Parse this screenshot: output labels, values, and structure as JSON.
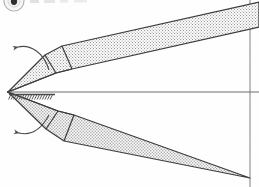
{
  "figure": {
    "kind": "technical-line-drawing",
    "canvas": {
      "width": 259,
      "height": 187
    },
    "background_color": "#fefefe",
    "ink_color": "#3a3a3a",
    "stipple_color": "#8e8e8e",
    "stipple_fill_tone": "#d2d2d2",
    "marker": {
      "name": "figure-number-badge",
      "label": "",
      "clipped": true,
      "cx": 14,
      "cy": 1,
      "r": 10
    },
    "axis": {
      "name": "axis-of-symmetry",
      "y": 92,
      "x_start": 8,
      "x_end": 259,
      "color": "#6d6d6d"
    },
    "hatch_line": {
      "name": "hatched-ground-line",
      "y": 95,
      "x_start": 9,
      "x_end": 55,
      "tick_count": 17,
      "tick_length": 6
    },
    "frame_right_x": 250,
    "apex": {
      "x": 8,
      "y": 92
    },
    "upper_body": {
      "name": "upper-wedge",
      "points": "8,92 45,55 62,46 259,2 259,27 72,69 56,73"
    },
    "upper_inner_panel": {
      "name": "upper-inner-panel",
      "points": "8,92 45,55 62,46 72,69 56,73"
    },
    "lower_body": {
      "name": "lower-wedge",
      "points": "8,92 46,129 64,141 250,178 250,178 74,115 58,111"
    },
    "lower_inner_panel": {
      "name": "lower-inner-panel",
      "points": "8,92 46,129 64,141 74,115 58,111"
    },
    "upper_tail_edge": "62,46 259,2",
    "lower_tail_edge": "64,141 250,178",
    "leaders": [
      {
        "name": "upper-angle-leader",
        "path": "M 18,47 C 31,44 44,53 49,70",
        "arrow_at": {
          "x": 18,
          "y": 47,
          "angle": -155
        }
      },
      {
        "name": "lower-angle-leader",
        "path": "M 19,133 C 32,136 42,128 49,115",
        "arrow_at": {
          "x": 19,
          "y": 133,
          "angle": 155
        }
      }
    ]
  }
}
